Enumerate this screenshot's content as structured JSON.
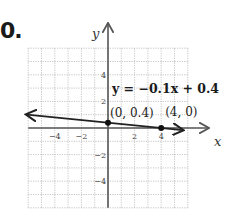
{
  "problem": {
    "number": "0."
  },
  "chart_data": {
    "type": "line",
    "title": "",
    "xlabel": "x",
    "ylabel": "y",
    "xlim": [
      -6,
      6
    ],
    "ylim": [
      -6,
      6
    ],
    "grid": true,
    "x_ticks": [
      -4,
      -2,
      2,
      4
    ],
    "y_ticks": [
      4,
      2,
      -2,
      -4
    ],
    "x_tick_labels": [
      "−4",
      "−2",
      "2",
      "4"
    ],
    "y_tick_labels": [
      "4",
      "2",
      "−2",
      "−4"
    ],
    "series": [
      {
        "name": "y = −0.1x + 0.4",
        "slope": -0.1,
        "intercept": 0.4,
        "x": [
          -6,
          0,
          4,
          6
        ],
        "y": [
          1.0,
          0.4,
          0,
          -0.2
        ],
        "arrows": "both"
      }
    ],
    "points": [
      {
        "x": 0,
        "y": 0.4,
        "label": "(0, 0.4)"
      },
      {
        "x": 4,
        "y": 0,
        "label": "(4, 0)"
      }
    ],
    "annotations": [
      {
        "text": "y = −0.1x + 0.4",
        "near": [
          1,
          2.8
        ]
      }
    ]
  }
}
